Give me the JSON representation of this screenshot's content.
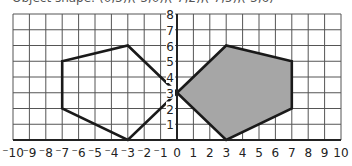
{
  "caption": "Object shape: (0,3),(-3,0),(-7,2),(-7,5),(-3,6)",
  "grid": {
    "x_min": -10,
    "x_max": 10,
    "y_min": 0,
    "y_max": 8,
    "x_ticks": [
      "-10",
      "-9",
      "-8",
      "-7",
      "-6",
      "-5",
      "-4",
      "-3",
      "-2",
      "-1",
      "0",
      "1",
      "2",
      "3",
      "4",
      "5",
      "6",
      "7",
      "8",
      "9",
      "10"
    ],
    "y_ticks": [
      "1",
      "2",
      "3",
      "4",
      "5",
      "6",
      "7",
      "8"
    ]
  },
  "shapes": {
    "object": {
      "vertices": [
        [
          0,
          3
        ],
        [
          -3,
          6
        ],
        [
          -7,
          5
        ],
        [
          -7,
          2
        ],
        [
          -3,
          0
        ]
      ],
      "fill": "none",
      "stroke": "#1a1a1a"
    },
    "image": {
      "vertices": [
        [
          0,
          3
        ],
        [
          3,
          6
        ],
        [
          7,
          5
        ],
        [
          7,
          2
        ],
        [
          3,
          0
        ]
      ],
      "fill": "#a6a6a6",
      "stroke": "#1a1a1a"
    }
  },
  "colors": {
    "grid": "#555555",
    "axis": "#222222",
    "shaded": "#a6a6a6"
  }
}
